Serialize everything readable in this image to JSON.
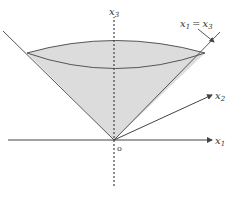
{
  "diagram": {
    "type": "cone-region",
    "labels": {
      "x3_axis": {
        "base": "x",
        "sub": "3"
      },
      "x1_axis": {
        "base": "x",
        "sub": "1"
      },
      "x2_axis": {
        "base": "x",
        "sub": "2"
      },
      "origin": "o",
      "cone_eq_lhs": {
        "base": "x",
        "sub": "1"
      },
      "cone_eq_op": "=",
      "cone_eq_rhs": {
        "base": "x",
        "sub": "3"
      }
    },
    "colors": {
      "fill": "#d9d9d9",
      "stroke": "#555555",
      "axis": "#444444"
    }
  }
}
